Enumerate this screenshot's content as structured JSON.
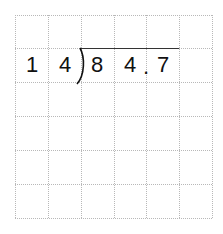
{
  "problem": {
    "type": "long-division",
    "divisor": "14",
    "dividend": "84.7",
    "cells": [
      {
        "row": 1,
        "col": 0,
        "text": "1"
      },
      {
        "row": 1,
        "col": 1,
        "text": "4"
      },
      {
        "row": 1,
        "col": 2,
        "text": "8"
      },
      {
        "row": 1,
        "col": 3,
        "text": "4"
      },
      {
        "row": 1,
        "col": 4,
        "text": "7"
      }
    ],
    "decimal_point": "."
  },
  "grid": {
    "rows": 6,
    "cols": 6,
    "line_color": "#b8b8b8"
  }
}
